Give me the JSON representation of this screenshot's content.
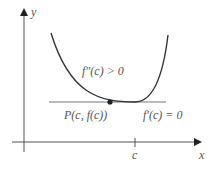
{
  "diagram": {
    "axes": {
      "x_label": "x",
      "y_label": "y"
    },
    "labels": {
      "concavity_condition": "f″(c) > 0",
      "point_label": "P(c, f(c))",
      "derivative_condition": "f′(c) = 0",
      "tick_c": "c"
    },
    "colors": {
      "curve": "#333333",
      "axis": "#444444",
      "tangent": "#666666",
      "point": "#222222",
      "text": "#555555"
    }
  }
}
